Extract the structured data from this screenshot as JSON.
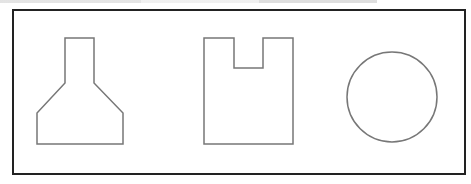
{
  "diagram": {
    "frame": {
      "x": 13,
      "y": 10,
      "width": 452,
      "height": 164,
      "stroke": "#222222",
      "stroke_width": 2
    },
    "shape_stroke": "#777777",
    "shapes": [
      {
        "name": "flask-shape",
        "type": "polygon",
        "points": "65,38 94,38 94,83 123,113 123,144 37,144 37,113 65,83"
      },
      {
        "name": "notched-rectangle",
        "type": "polygon",
        "points": "204,38 234,38 234,68 263,68 263,38 293,38 293,144 204,144"
      },
      {
        "name": "circle-shape",
        "type": "circle",
        "cx": 392,
        "cy": 97,
        "r": 45
      }
    ]
  }
}
